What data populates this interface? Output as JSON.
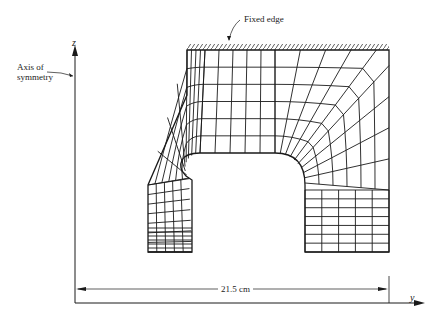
{
  "labels": {
    "fixed_edge": "Fixed edge",
    "axis_line1": "Axis of",
    "axis_line2": "symmetry",
    "z_axis": "z",
    "y_axis": "y",
    "dimension": "21.5 cm"
  },
  "colors": {
    "line": "#1a1a1a",
    "background": "#ffffff"
  }
}
